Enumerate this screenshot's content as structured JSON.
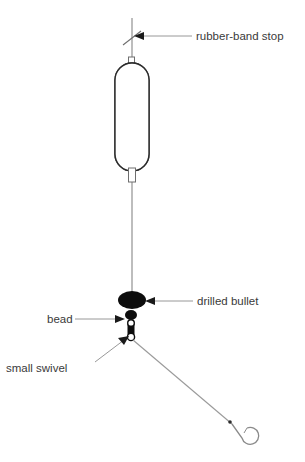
{
  "diagram": {
    "background_color": "#ffffff",
    "line_color": "#9a9a9a",
    "ink_color": "#0d0d0d",
    "text_color": "#3a3a3a",
    "labels": [
      {
        "id": "rubber-band-stop",
        "text": "rubber-band stop",
        "x": 196,
        "y": 36
      },
      {
        "id": "drilled-bullet",
        "text": "drilled bullet",
        "x": 197,
        "y": 304
      },
      {
        "id": "bead",
        "text": "bead",
        "x": 47,
        "y": 324
      },
      {
        "id": "small-swivel",
        "text": "small swivel",
        "x": 6,
        "y": 370
      }
    ],
    "components": [
      {
        "id": "main-line",
        "name": "fishing line",
        "kind": "line"
      },
      {
        "id": "rubber-band-stop",
        "name": "rubber-band stop",
        "kind": "stop-mark"
      },
      {
        "id": "slip-float",
        "name": "slip float",
        "kind": "capsule",
        "top_color": "#0d0d0d",
        "bottom_color": "#ffffff"
      },
      {
        "id": "drilled-bullet",
        "name": "drilled bullet weight",
        "kind": "ellipse"
      },
      {
        "id": "bead",
        "name": "bead",
        "kind": "ellipse"
      },
      {
        "id": "small-swivel",
        "name": "small swivel",
        "kind": "swivel"
      },
      {
        "id": "leader",
        "name": "leader line",
        "kind": "line"
      },
      {
        "id": "hook",
        "name": "hook",
        "kind": "hook"
      }
    ]
  }
}
